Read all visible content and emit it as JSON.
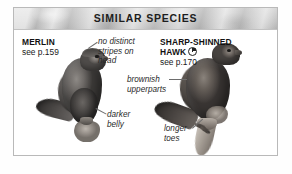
{
  "panel": {
    "header_title": "SIMILAR SPECIES",
    "border_color": "#b9b9b9",
    "header_bg_color": "#cfcfcf",
    "body_bg_color": "#ffffff"
  },
  "species": [
    {
      "name": "MERLIN",
      "page_ref": "see p.159",
      "has_season_icon": false,
      "icon_name": ""
    },
    {
      "name": "SHARP-SHINNED",
      "name_line2": "HAWK",
      "page_ref": "see p.170",
      "has_season_icon": true,
      "icon_name": "quarter-pie-season-icon"
    }
  ],
  "callouts": [
    {
      "id": "no-distinct-stripes",
      "line1": "no distinct",
      "line2": "stripes on",
      "line3": "head"
    },
    {
      "id": "darker-belly",
      "line1": "darker",
      "line2": "belly"
    },
    {
      "id": "brownish-upperparts",
      "line1": "brownish",
      "line2": "upperparts"
    },
    {
      "id": "longer-toes",
      "line1": "longer",
      "line2": "toes"
    }
  ],
  "illustrations": [
    {
      "id": "merlin-illustration",
      "alt": "perched Merlin falcon facing right"
    },
    {
      "id": "sharp-shinned-hawk-illustration",
      "alt": "perched Sharp-shinned Hawk facing right on branch"
    }
  ]
}
